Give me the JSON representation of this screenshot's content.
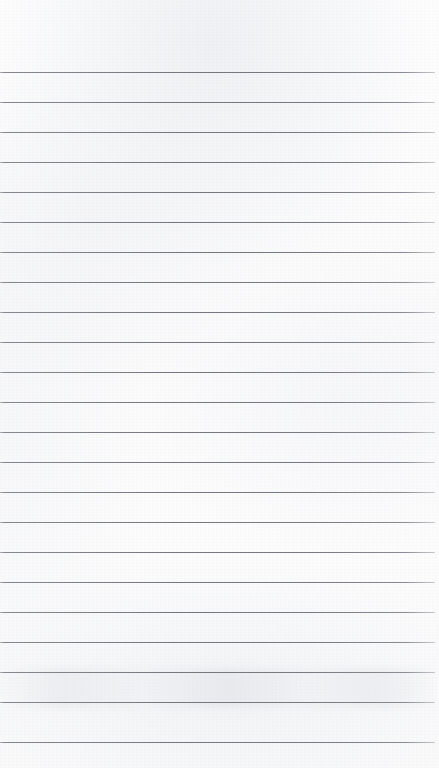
{
  "document": {
    "kind": "scanned-ruled-paper",
    "title": "Blank Lined Paper",
    "page_width": 439,
    "page_height": 768,
    "content_text": "",
    "has_handwriting": false,
    "has_printed_text": false,
    "orientation": "portrait"
  },
  "paper": {
    "background_color": "#fcfcfc",
    "edge_tint_color": "#f0f1f4",
    "texture": "scan-grain",
    "smudge_band_top": 668,
    "smudge_band_height": 40
  },
  "ruling": {
    "style": "horizontal-ruled",
    "line_color": "#6e7078",
    "line_thickness_px": 1,
    "line_spacing_px": 30,
    "first_line_y": 72,
    "last_line_y": 742,
    "line_count": 23,
    "left_inset_px": 0,
    "right_end_px": 435,
    "top_margin_px": 72,
    "bottom_margin_px": 26,
    "has_vertical_margin_rule": false,
    "line_y_positions": [
      72,
      102,
      132,
      162,
      192,
      222,
      252,
      282,
      312,
      342,
      372,
      402,
      432,
      462,
      492,
      522,
      552,
      582,
      612,
      642,
      672,
      702,
      742
    ]
  }
}
